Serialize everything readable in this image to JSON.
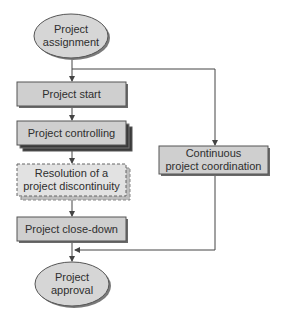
{
  "diagram": {
    "type": "flowchart",
    "colors": {
      "fill": "#cfcfcf",
      "ellipse_fill": "#d6d6d6",
      "dashed_fill": "#e0e0e0",
      "stroke": "#555555",
      "shadow": "#6a6a6a",
      "text": "#2e2e2e",
      "line": "#444444"
    },
    "nodes": [
      {
        "id": "project-assignment",
        "shape": "ellipse",
        "line1": "Project",
        "line2": "assignment"
      },
      {
        "id": "project-start",
        "shape": "box",
        "label": "Project start"
      },
      {
        "id": "project-controlling",
        "shape": "stacked-box",
        "label": "Project controlling"
      },
      {
        "id": "resolution",
        "shape": "dashed-box",
        "line1": "Resolution of a",
        "line2": "project discontinuity"
      },
      {
        "id": "project-close-down",
        "shape": "box",
        "label": "Project close-down"
      },
      {
        "id": "project-approval",
        "shape": "ellipse",
        "line1": "Project",
        "line2": "approval"
      },
      {
        "id": "continuous-coordination",
        "shape": "box",
        "line1": "Continuous",
        "line2": "project coordination"
      }
    ],
    "edges": [
      {
        "from": "project-assignment",
        "to": "project-start"
      },
      {
        "from": "project-start",
        "to": "project-controlling"
      },
      {
        "from": "project-controlling",
        "to": "resolution"
      },
      {
        "from": "resolution",
        "to": "project-close-down"
      },
      {
        "from": "project-close-down",
        "to": "project-approval"
      },
      {
        "from": "project-assignment",
        "to": "continuous-coordination"
      },
      {
        "from": "continuous-coordination",
        "to": "project-approval"
      }
    ]
  }
}
